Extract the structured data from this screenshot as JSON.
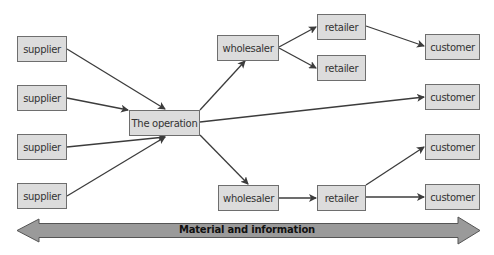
{
  "diagram": {
    "type": "supply network flow",
    "nodes": {
      "suppliers": [
        "supplier",
        "supplier",
        "supplier",
        "supplier"
      ],
      "operation": "The operation",
      "wholesaler_top": "wholesaler",
      "retailer_top_1": "retailer",
      "retailer_top_2": "retailer",
      "wholesaler_bottom": "wholesaler",
      "retailer_bottom": "retailer",
      "customers": [
        "customer",
        "customer",
        "customer",
        "customer"
      ]
    },
    "edges": [
      [
        "supplier 1",
        "The operation"
      ],
      [
        "supplier 2",
        "The operation"
      ],
      [
        "supplier 3",
        "The operation"
      ],
      [
        "supplier 4",
        "The operation"
      ],
      [
        "The operation",
        "wholesaler (top)"
      ],
      [
        "The operation",
        "customer 2"
      ],
      [
        "The operation",
        "wholesaler (bottom)"
      ],
      [
        "wholesaler (top)",
        "retailer 1"
      ],
      [
        "wholesaler (top)",
        "retailer 2"
      ],
      [
        "retailer 1",
        "customer 1"
      ],
      [
        "wholesaler (bottom)",
        "retailer (bottom)"
      ],
      [
        "retailer (bottom)",
        "customer 3"
      ],
      [
        "retailer (bottom)",
        "customer 4"
      ]
    ],
    "flow_arrow": {
      "label": "Material and information",
      "direction": "bidirectional"
    },
    "colors": {
      "box_fill": "#dcdcdc",
      "box_border": "#6e6e6e",
      "line": "#3c3c3c",
      "flow_arrow_fill": "#9a9a9a"
    }
  }
}
